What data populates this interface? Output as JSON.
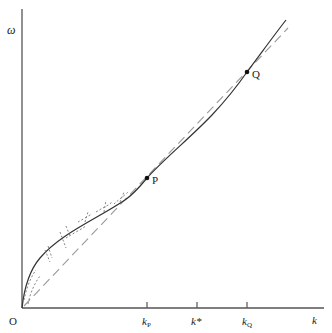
{
  "diagram": {
    "y_axis_label": "ω",
    "x_axis_label": "k",
    "origin_label": "O",
    "points": [
      {
        "name": "P",
        "label": "P"
      },
      {
        "name": "Q",
        "label": "Q"
      }
    ],
    "x_ticks": [
      {
        "main": "k",
        "sub": "P"
      },
      {
        "main": "k*",
        "sub": ""
      },
      {
        "main": "k",
        "sub": "Q"
      }
    ],
    "curves": [
      {
        "name": "solid-curve",
        "style": "solid"
      },
      {
        "name": "dashed-line",
        "style": "dashed"
      },
      {
        "name": "fluctuation-marks",
        "style": "dashed-short"
      }
    ],
    "colors": {
      "line": "#222222",
      "dashed": "#999999",
      "background": "#ffffff"
    }
  }
}
